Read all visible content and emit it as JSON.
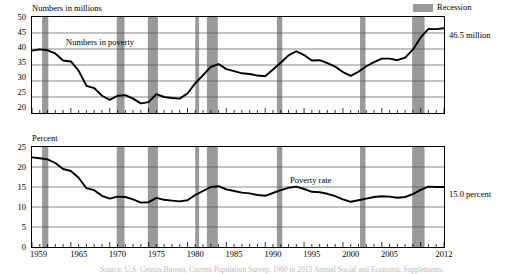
{
  "legend": {
    "recession_label": "Recession",
    "recession_color": "#9a9a9a"
  },
  "footnote": {
    "text": "Source: U.S. Census Bureau, Current Population Survey, 1960 to 2013 Annual Social and Economic Supplements."
  },
  "chart_data": [
    {
      "type": "line",
      "id": "numbers-in-poverty",
      "title": "Numbers in millions",
      "ylabel": "Numbers in millions",
      "xlabel": "",
      "series_label": "Numbers in poverty",
      "end_label": "46.5 million",
      "grid": true,
      "legend_position": "top-right",
      "xlim": [
        1959,
        2012
      ],
      "ylim": [
        20,
        50
      ],
      "yticks": [
        20,
        25,
        30,
        35,
        40,
        45,
        50
      ],
      "xticks": [
        1959,
        1965,
        1970,
        1975,
        1980,
        1985,
        1990,
        1995,
        2000,
        2005,
        2012
      ],
      "x": [
        1959,
        1960,
        1961,
        1962,
        1963,
        1964,
        1965,
        1966,
        1967,
        1968,
        1969,
        1970,
        1971,
        1972,
        1973,
        1974,
        1975,
        1976,
        1977,
        1978,
        1979,
        1980,
        1981,
        1982,
        1983,
        1984,
        1985,
        1986,
        1987,
        1988,
        1989,
        1990,
        1991,
        1992,
        1993,
        1994,
        1995,
        1996,
        1997,
        1998,
        1999,
        2000,
        2001,
        2002,
        2003,
        2004,
        2005,
        2006,
        2007,
        2008,
        2009,
        2010,
        2011,
        2012
      ],
      "values": [
        39.5,
        39.9,
        39.6,
        38.6,
        36.4,
        36.1,
        33.2,
        28.5,
        27.8,
        25.4,
        24.1,
        25.4,
        25.6,
        24.5,
        23.0,
        23.4,
        25.9,
        25.0,
        24.7,
        24.5,
        26.1,
        29.3,
        31.8,
        34.4,
        35.3,
        33.7,
        33.1,
        32.4,
        32.2,
        31.7,
        31.5,
        33.6,
        35.7,
        38.0,
        39.3,
        38.1,
        36.4,
        36.5,
        35.6,
        34.5,
        32.8,
        31.6,
        32.9,
        34.6,
        35.9,
        37.0,
        37.0,
        36.5,
        37.3,
        39.8,
        43.6,
        46.3,
        46.2,
        46.5
      ]
    },
    {
      "type": "line",
      "id": "poverty-rate",
      "title": "Percent",
      "ylabel": "Percent",
      "xlabel": "",
      "series_label": "Poverty rate",
      "end_label": "15.0 percent",
      "grid": true,
      "legend_position": "none",
      "xlim": [
        1959,
        2012
      ],
      "ylim": [
        0,
        25
      ],
      "yticks": [
        0,
        5,
        10,
        15,
        20,
        25
      ],
      "xticks": [
        1959,
        1965,
        1970,
        1975,
        1980,
        1985,
        1990,
        1995,
        2000,
        2005,
        2012
      ],
      "x": [
        1959,
        1960,
        1961,
        1962,
        1963,
        1964,
        1965,
        1966,
        1967,
        1968,
        1969,
        1970,
        1971,
        1972,
        1973,
        1974,
        1975,
        1976,
        1977,
        1978,
        1979,
        1980,
        1981,
        1982,
        1983,
        1984,
        1985,
        1986,
        1987,
        1988,
        1989,
        1990,
        1991,
        1992,
        1993,
        1994,
        1995,
        1996,
        1997,
        1998,
        1999,
        2000,
        2001,
        2002,
        2003,
        2004,
        2005,
        2006,
        2007,
        2008,
        2009,
        2010,
        2011,
        2012
      ],
      "values": [
        22.4,
        22.2,
        21.9,
        21.0,
        19.5,
        19.0,
        17.3,
        14.7,
        14.2,
        12.8,
        12.1,
        12.6,
        12.5,
        11.9,
        11.1,
        11.2,
        12.3,
        11.8,
        11.6,
        11.4,
        11.7,
        13.0,
        14.0,
        15.0,
        15.2,
        14.4,
        14.0,
        13.6,
        13.4,
        13.0,
        12.8,
        13.5,
        14.2,
        14.8,
        15.1,
        14.5,
        13.8,
        13.7,
        13.3,
        12.7,
        11.9,
        11.3,
        11.7,
        12.1,
        12.5,
        12.7,
        12.6,
        12.3,
        12.5,
        13.2,
        14.3,
        15.1,
        15.0,
        15.0
      ]
    }
  ],
  "recessions": [
    {
      "start": 1960.3,
      "end": 1961.1
    },
    {
      "start": 1969.9,
      "end": 1970.9
    },
    {
      "start": 1973.9,
      "end": 1975.2
    },
    {
      "start": 1980.0,
      "end": 1980.5
    },
    {
      "start": 1981.5,
      "end": 1982.9
    },
    {
      "start": 1990.5,
      "end": 1991.2
    },
    {
      "start": 2001.2,
      "end": 2001.9
    },
    {
      "start": 2007.9,
      "end": 2009.5
    }
  ]
}
